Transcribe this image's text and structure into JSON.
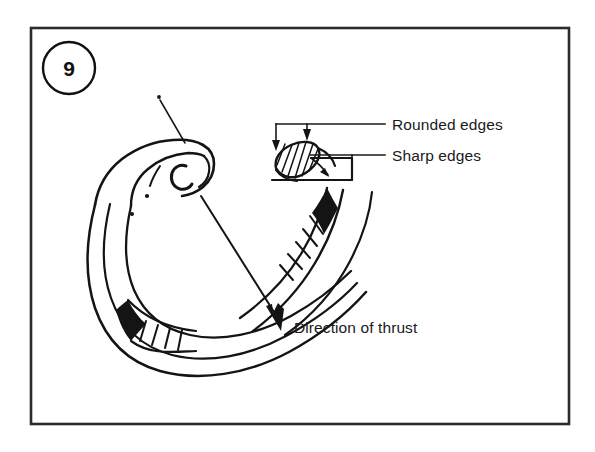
{
  "figure": {
    "number": "9",
    "background_color": "#ffffff",
    "ink_color": "#141414",
    "frame_color": "#2b2b2b"
  },
  "labels": {
    "rounded_edges": "Rounded edges",
    "sharp_edges": "Sharp edges",
    "direction_of_thrust": "Direction of thrust"
  },
  "annotations": {
    "callout_top": "rounded-edges-callout",
    "callout_bottom": "sharp-edges-callout",
    "thrust_arrow": "direction-of-thrust-arrow",
    "cross_section": "ring-cross-section-hatched",
    "lug_pointer": "ring-lug-pointer-line"
  }
}
